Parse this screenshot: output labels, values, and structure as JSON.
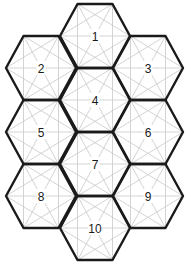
{
  "puzzle": {
    "radius": 35,
    "half_height": 32,
    "colors": {
      "outline": "#1a1a1a",
      "grid": "#c8c8c8",
      "background": "#ffffff"
    },
    "hexes": [
      {
        "label": "1",
        "cx": 95,
        "cy": 36
      },
      {
        "label": "2",
        "cx": 41,
        "cy": 68
      },
      {
        "label": "3",
        "cx": 148,
        "cy": 68
      },
      {
        "label": "4",
        "cx": 95,
        "cy": 100
      },
      {
        "label": "5",
        "cx": 41,
        "cy": 132
      },
      {
        "label": "6",
        "cx": 148,
        "cy": 132
      },
      {
        "label": "7",
        "cx": 95,
        "cy": 164
      },
      {
        "label": "8",
        "cx": 41,
        "cy": 196
      },
      {
        "label": "9",
        "cx": 148,
        "cy": 196
      },
      {
        "label": "10",
        "cx": 95,
        "cy": 228
      }
    ]
  }
}
